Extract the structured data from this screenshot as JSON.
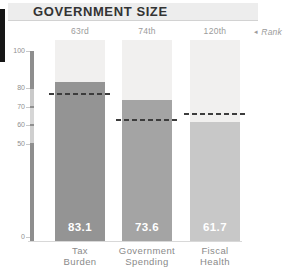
{
  "header": {
    "title": "GOVERNMENT SIZE"
  },
  "rank_legend": {
    "arrow": "◂",
    "label": "Rank"
  },
  "chart_data": {
    "type": "bar",
    "title": "GOVERNMENT SIZE",
    "categories": [
      "Tax Burden",
      "Government Spending",
      "Fiscal Health"
    ],
    "categories_multiline": [
      [
        "Tax",
        "Burden"
      ],
      [
        "Government",
        "Spending"
      ],
      [
        "Fiscal",
        "Health"
      ]
    ],
    "values": [
      83.1,
      73.6,
      61.7
    ],
    "value_labels": [
      "83.1",
      "73.6",
      "61.7"
    ],
    "ranks": [
      "63rd",
      "74th",
      "120th"
    ],
    "rank_note": "Rank",
    "reference_dashed_values": [
      77,
      63,
      66
    ],
    "ylim": [
      0,
      100
    ],
    "yticks": [
      100,
      80,
      70,
      60,
      50,
      0
    ],
    "grid": false,
    "legend_position": "top-right",
    "bar_colors": [
      "#949494",
      "#a4a4a4",
      "#c8c8c8"
    ],
    "track_color": "#f1f0ef",
    "dash_color": "#3c3c3c",
    "axis_bands": [
      {
        "from": 0,
        "to": 50,
        "color": "#8e8e8e"
      },
      {
        "from": 50,
        "to": 60,
        "color": "#cfcfcf"
      },
      {
        "from": 60,
        "to": 70,
        "color": "#d6d6d6"
      },
      {
        "from": 70,
        "to": 80,
        "color": "#c9c9c9"
      },
      {
        "from": 80,
        "to": 100,
        "color": "#8e8e8e"
      }
    ]
  }
}
